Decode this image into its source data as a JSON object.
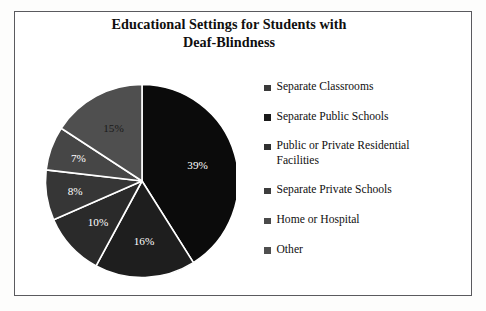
{
  "page": {
    "background_color": "#ffffff",
    "frame_border_color": "#5a5a5e"
  },
  "title": {
    "line1": "Educational Settings for Students with",
    "line2": "Deaf-Blindness",
    "full": "Educational Settings for Students with Deaf-Blindness",
    "color": "#100f0f"
  },
  "legend": {
    "position": "right",
    "items": [
      {
        "label": "Separate Classrooms",
        "color": "#3a3a3a"
      },
      {
        "label": "Separate Public Schools",
        "color": "#1a1a1a"
      },
      {
        "label": "Public or Private Residential Facilities",
        "color": "#303030"
      },
      {
        "label": "Separate Private Schools",
        "color": "#3d3d3d"
      },
      {
        "label": "Home or Hospital",
        "color": "#4a4a4a"
      },
      {
        "label": "Other",
        "color": "#4f4f4f"
      }
    ]
  },
  "chart_data": {
    "type": "pie",
    "title": "Educational Settings for Students with Deaf-Blindness",
    "xlabel": "",
    "ylabel": "",
    "units": "percent",
    "start_angle_deg": 0,
    "direction": "clockwise",
    "legend_position": "right",
    "grid": false,
    "categories": [
      "Separate Classrooms",
      "Separate Public Schools",
      "Public or Private Residential Facilities",
      "Separate Private Schools",
      "Home or Hospital",
      "Other"
    ],
    "values": [
      39,
      16,
      10,
      8,
      7,
      15
    ],
    "labels": [
      "39%",
      "16%",
      "10%",
      "8%",
      "7%",
      "15%"
    ],
    "colors": [
      "#0b0b0b",
      "#1e1e1e",
      "#2a2a2a",
      "#363636",
      "#464646",
      "#4f4f4f"
    ],
    "label_colors": [
      "#ffffff",
      "#ffffff",
      "#ffffff",
      "#ffffff",
      "#ffffff",
      "#1a1a1a"
    ],
    "separator_color": "#ffffff",
    "total": 95,
    "slices": [
      {
        "category": "Separate Classrooms",
        "value": 39,
        "label": "39%",
        "color": "#0b0b0b"
      },
      {
        "category": "Separate Public Schools",
        "value": 16,
        "label": "16%",
        "color": "#1e1e1e"
      },
      {
        "category": "Public or Private Residential Facilities",
        "value": 10,
        "label": "10%",
        "color": "#2a2a2a"
      },
      {
        "category": "Separate Private Schools",
        "value": 8,
        "label": "8%",
        "color": "#363636"
      },
      {
        "category": "Home or Hospital",
        "value": 7,
        "label": "7%",
        "color": "#464646"
      },
      {
        "category": "Other",
        "value": 15,
        "label": "15%",
        "color": "#4f4f4f"
      }
    ]
  }
}
